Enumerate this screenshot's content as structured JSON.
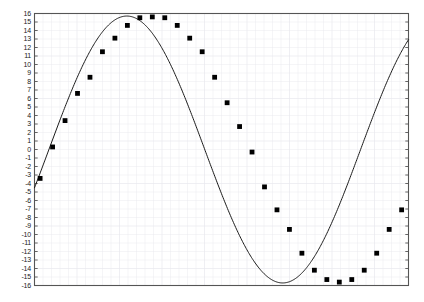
{
  "chart_data": {
    "type": "line",
    "title": "",
    "subtitle": "",
    "xlabel": "",
    "ylabel": "",
    "legend": [],
    "legend_position": "none",
    "grid": true,
    "grid_color": "#e8e8ee",
    "frame_color": "#555555",
    "line_color": "#1a1a1a",
    "marker_color": "#000000",
    "marker_shape": "square",
    "background_color": "#ffffff",
    "xlim": [
      0,
      30
    ],
    "ylim": [
      -16,
      16
    ],
    "x_tick_labels": [],
    "y_tick_labels": [
      "16",
      "15",
      "14",
      "13",
      "12",
      "11",
      "10",
      "9",
      "8",
      "7",
      "6",
      "5",
      "4",
      "3",
      "2",
      "1",
      "0",
      "-1",
      "-2",
      "-3",
      "-4",
      "-5",
      "-6",
      "-7",
      "-8",
      "-9",
      "-10",
      "-11",
      "-12",
      "-13",
      "-14",
      "-15",
      "-16"
    ],
    "y_tick_values": [
      16,
      15,
      14,
      13,
      12,
      11,
      10,
      9,
      8,
      7,
      6,
      5,
      4,
      3,
      2,
      1,
      0,
      -1,
      -2,
      -3,
      -4,
      -5,
      -6,
      -7,
      -8,
      -9,
      -10,
      -11,
      -12,
      -13,
      -14,
      -15,
      -16
    ],
    "series": [
      {
        "name": "sine",
        "x": [
          0.45,
          1.45,
          2.45,
          3.45,
          4.45,
          5.45,
          6.45,
          7.45,
          8.45,
          9.45,
          10.45,
          11.45,
          12.45,
          13.45,
          14.45,
          15.45,
          16.45,
          17.45,
          18.45,
          19.45,
          20.45,
          21.45,
          22.45,
          23.45,
          24.45,
          25.45,
          26.45,
          27.45,
          28.45,
          29.45
        ],
        "values": [
          -3.4,
          0.3,
          3.4,
          6.6,
          8.5,
          11.5,
          13.1,
          14.6,
          15.5,
          15.6,
          15.5,
          14.6,
          13.1,
          11.5,
          8.5,
          5.5,
          2.7,
          -0.3,
          -4.4,
          -7.1,
          -9.4,
          -12.2,
          -14.2,
          -15.3,
          -15.6,
          -15.3,
          -14.2,
          -12.2,
          -9.4,
          -7.1
        ]
      }
    ],
    "curve": {
      "name": "fitted-sine",
      "amplitude": 15.7,
      "y_offset": 0.0,
      "period": 25.0,
      "phase_start_value": -4.5,
      "peak_value": 16.0,
      "trough_value": -15.8,
      "end_value": 3.1
    }
  }
}
